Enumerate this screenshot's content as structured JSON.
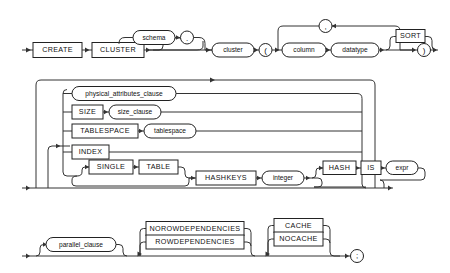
{
  "diagram": {
    "title": "CREATE CLUSTER",
    "type": "railroad-syntax-diagram",
    "line_color": "#333333",
    "box_stroke": "#222222",
    "background": "#ffffff",
    "rows": [
      {
        "id": "row-1",
        "tokens": [
          {
            "name": "create",
            "label": "CREATE",
            "shape": "box"
          },
          {
            "name": "cluster-kw",
            "label": "CLUSTER",
            "shape": "box"
          },
          {
            "name": "schema",
            "label": "schema",
            "shape": "oval",
            "optional": true
          },
          {
            "name": "dot",
            "label": ".",
            "shape": "circle",
            "optional": true
          },
          {
            "name": "cluster-name",
            "label": "cluster",
            "shape": "oval"
          },
          {
            "name": "lparen",
            "label": "(",
            "shape": "circle"
          },
          {
            "name": "column",
            "label": "column",
            "shape": "oval"
          },
          {
            "name": "datatype",
            "label": "datatype",
            "shape": "oval"
          },
          {
            "name": "sort",
            "label": "SORT",
            "shape": "box",
            "optional": true
          },
          {
            "name": "comma-loop",
            "label": ",",
            "shape": "circle",
            "loop": true
          },
          {
            "name": "rparen",
            "label": ")",
            "shape": "circle"
          }
        ]
      },
      {
        "id": "row-2",
        "tokens": [
          {
            "name": "physical-attributes-clause",
            "label": "physical_attributes_clause",
            "shape": "oval"
          },
          {
            "name": "size",
            "label": "SIZE",
            "shape": "box"
          },
          {
            "name": "size-clause",
            "label": "size_clause",
            "shape": "oval"
          },
          {
            "name": "tablespace-kw",
            "label": "TABLESPACE",
            "shape": "box"
          },
          {
            "name": "tablespace",
            "label": "tablespace",
            "shape": "oval"
          },
          {
            "name": "index",
            "label": "INDEX",
            "shape": "box"
          },
          {
            "name": "single",
            "label": "SINGLE",
            "shape": "box",
            "optional": true
          },
          {
            "name": "table",
            "label": "TABLE",
            "shape": "box"
          },
          {
            "name": "hashkeys",
            "label": "HASHKEYS",
            "shape": "box"
          },
          {
            "name": "integer",
            "label": "integer",
            "shape": "oval"
          },
          {
            "name": "hash",
            "label": "HASH",
            "shape": "box",
            "optional": true
          },
          {
            "name": "is",
            "label": "IS",
            "shape": "box"
          },
          {
            "name": "expr",
            "label": "expr",
            "shape": "oval"
          }
        ]
      },
      {
        "id": "row-3",
        "tokens": [
          {
            "name": "parallel-clause",
            "label": "parallel_clause",
            "shape": "oval",
            "optional": true
          },
          {
            "name": "norowdependencies",
            "label": "NOROWDEPENDENCIES",
            "shape": "box",
            "optional": true
          },
          {
            "name": "rowdependencies",
            "label": "ROWDEPENDENCIES",
            "shape": "box",
            "optional": true
          },
          {
            "name": "cache",
            "label": "CACHE",
            "shape": "box",
            "optional": true
          },
          {
            "name": "nocache",
            "label": "NOCACHE",
            "shape": "box",
            "optional": true
          },
          {
            "name": "semicolon",
            "label": ";",
            "shape": "circle"
          }
        ]
      }
    ],
    "labels": {
      "create": "CREATE",
      "cluster_kw": "CLUSTER",
      "schema": "schema",
      "dot": ".",
      "cluster_name": "cluster",
      "lparen": "(",
      "column": "column",
      "datatype": "datatype",
      "sort": "SORT",
      "comma": ",",
      "rparen": ")",
      "physical_attributes_clause": "physical_attributes_clause",
      "size": "SIZE",
      "size_clause": "size_clause",
      "tablespace_kw": "TABLESPACE",
      "tablespace": "tablespace",
      "index": "INDEX",
      "single": "SINGLE",
      "table": "TABLE",
      "hashkeys": "HASHKEYS",
      "integer": "integer",
      "hash": "HASH",
      "is": "IS",
      "expr": "expr",
      "parallel_clause": "parallel_clause",
      "norowdependencies": "NOROWDEPENDENCIES",
      "rowdependencies": "ROWDEPENDENCIES",
      "cache": "CACHE",
      "nocache": "NOCACHE",
      "semicolon": ";"
    }
  }
}
